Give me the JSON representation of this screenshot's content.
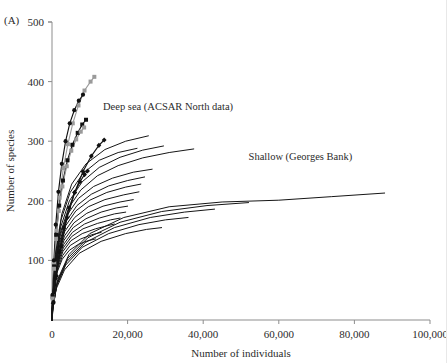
{
  "panel": {
    "label": "(A)"
  },
  "axes": {
    "x": {
      "title": "Number of individuals",
      "ticks": [
        0,
        20000,
        40000,
        60000,
        80000,
        100000
      ],
      "tick_labels": [
        "0",
        "20,000",
        "40,000",
        "60,000",
        "80,000",
        "100,000"
      ],
      "min": 0,
      "max": 100000
    },
    "y": {
      "title": "Number of species",
      "ticks": [
        100,
        200,
        300,
        400,
        500
      ],
      "tick_labels": [
        "100",
        "200",
        "300",
        "400",
        "500"
      ],
      "min": 0,
      "max": 500
    }
  },
  "annotations": [
    {
      "name": "deep-sea-label",
      "text": "Deep sea (ACSAR North data)",
      "x": 13500,
      "y": 352
    },
    {
      "name": "shallow-label",
      "text": "Shallow (Georges Bank)",
      "x": 52000,
      "y": 268
    }
  ],
  "chart_data": {
    "type": "line",
    "title": "",
    "xlabel": "Number of individuals",
    "ylabel": "Number of species",
    "xlim": [
      0,
      100000
    ],
    "ylim": [
      0,
      500
    ],
    "grid": false,
    "legend": "none",
    "annotations": [
      "Deep sea (ACSAR North data)",
      "Shallow (Georges Bank)"
    ],
    "series": [
      {
        "name": "deep-sea-marked-gray-squares",
        "group": "Deep sea (ACSAR North data)",
        "marker": "square",
        "marker_color": "#9a9a9a",
        "line_color": "#9a9a9a",
        "x": [
          200,
          600,
          1200,
          2000,
          3000,
          4200,
          5500,
          7000,
          8600,
          10200,
          11200
        ],
        "y": [
          40,
          95,
          150,
          205,
          255,
          295,
          330,
          360,
          385,
          400,
          408
        ]
      },
      {
        "name": "deep-sea-marked-black-circles",
        "group": "Deep sea (ACSAR North data)",
        "marker": "circle",
        "marker_color": "#111111",
        "line_color": "#111111",
        "x": [
          150,
          500,
          1000,
          1700,
          2600,
          3600,
          4700,
          5900,
          7100,
          8200
        ],
        "y": [
          42,
          100,
          160,
          215,
          262,
          300,
          330,
          352,
          368,
          378
        ]
      },
      {
        "name": "deep-sea-marked-black-squares",
        "group": "Deep sea (ACSAR North data)",
        "marker": "square",
        "marker_color": "#111111",
        "line_color": "#111111",
        "x": [
          180,
          550,
          1100,
          1900,
          2900,
          4100,
          5400,
          6800,
          8000,
          9000
        ],
        "y": [
          38,
          90,
          143,
          192,
          234,
          268,
          294,
          314,
          328,
          336
        ]
      },
      {
        "name": "deep-sea-marked-gray-squares-2",
        "group": "Deep sea (ACSAR North data)",
        "marker": "square",
        "marker_color": "#9a9a9a",
        "line_color": "#9a9a9a",
        "x": [
          160,
          520,
          1050,
          1800,
          2750,
          3900,
          5100,
          6400,
          7600,
          8500
        ],
        "y": [
          36,
          86,
          136,
          183,
          224,
          258,
          284,
          303,
          316,
          323
        ]
      },
      {
        "name": "deep-sea-marked-black-diamonds",
        "group": "Deep sea (ACSAR North data)",
        "marker": "diamond",
        "marker_color": "#111111",
        "line_color": "#111111",
        "x": [
          400,
          1200,
          2400,
          4000,
          6000,
          8200,
          10400,
          12400,
          13800
        ],
        "y": [
          30,
          74,
          124,
          172,
          214,
          249,
          275,
          293,
          302
        ]
      },
      {
        "name": "deep-sea-marked-black-diamonds-2",
        "group": "Deep sea (ACSAR North data)",
        "marker": "diamond",
        "marker_color": "#111111",
        "line_color": "#111111",
        "x": [
          300,
          950,
          1900,
          3100,
          4500,
          6000,
          7400,
          8600,
          9400
        ],
        "y": [
          28,
          70,
          114,
          154,
          188,
          214,
          232,
          244,
          250
        ]
      },
      {
        "name": "deep-sea-plain-1",
        "group": "Deep sea (ACSAR North data)",
        "marker": "none",
        "x": [
          120,
          900,
          2600,
          5200,
          9000,
          14000,
          19500,
          25500
        ],
        "y": [
          30,
          110,
          178,
          228,
          262,
          286,
          300,
          309
        ]
      },
      {
        "name": "deep-sea-plain-2",
        "group": "Deep sea (ACSAR North data)",
        "marker": "none",
        "x": [
          120,
          850,
          2400,
          4800,
          8200,
          12500,
          17500,
          22500
        ],
        "y": [
          28,
          104,
          168,
          214,
          246,
          268,
          281,
          288
        ]
      },
      {
        "name": "deep-sea-plain-3",
        "group": "Deep sea (ACSAR North data)",
        "marker": "none",
        "x": [
          110,
          800,
          2300,
          4600,
          8000,
          12500,
          18000,
          24000,
          29500
        ],
        "y": [
          26,
          96,
          156,
          200,
          232,
          256,
          273,
          285,
          292
        ]
      },
      {
        "name": "deep-sea-plain-4",
        "group": "Deep sea (ACSAR North data)",
        "marker": "none",
        "x": [
          110,
          780,
          2200,
          4400,
          7600,
          12000,
          17500,
          24000,
          31000,
          37500
        ],
        "y": [
          25,
          90,
          146,
          188,
          218,
          242,
          259,
          272,
          281,
          287
        ]
      },
      {
        "name": "deep-sea-plain-5",
        "group": "Deep sea (ACSAR North data)",
        "marker": "none",
        "x": [
          100,
          700,
          2000,
          4000,
          7000,
          11000,
          16000,
          21500,
          26500
        ],
        "y": [
          24,
          86,
          138,
          176,
          204,
          224,
          238,
          248,
          253
        ]
      },
      {
        "name": "deep-sea-plain-6",
        "group": "Deep sea (ACSAR North data)",
        "marker": "none",
        "x": [
          100,
          700,
          1900,
          3800,
          6600,
          10400,
          15000,
          20000,
          24500
        ],
        "y": [
          23,
          82,
          130,
          166,
          192,
          211,
          225,
          234,
          240
        ]
      },
      {
        "name": "deep-sea-plain-7",
        "group": "Deep sea (ACSAR North data)",
        "marker": "none",
        "x": [
          95,
          650,
          1800,
          3600,
          6300,
          10000,
          14500,
          19500,
          23500
        ],
        "y": [
          22,
          78,
          124,
          158,
          183,
          201,
          214,
          223,
          228
        ]
      },
      {
        "name": "deep-sea-plain-8",
        "group": "Deep sea (ACSAR North data)",
        "marker": "none",
        "x": [
          90,
          620,
          1700,
          3400,
          6000,
          9600,
          14000,
          19000,
          23000
        ],
        "y": [
          21,
          74,
          117,
          149,
          172,
          190,
          202,
          210,
          215
        ]
      },
      {
        "name": "deep-sea-plain-9",
        "group": "Deep sea (ACSAR North data)",
        "marker": "none",
        "x": [
          90,
          600,
          1650,
          3300,
          5800,
          9200,
          13500,
          18000,
          21500
        ],
        "y": [
          20,
          70,
          111,
          141,
          163,
          179,
          191,
          198,
          202
        ]
      },
      {
        "name": "deep-sea-plain-10",
        "group": "Deep sea (ACSAR North data)",
        "marker": "none",
        "x": [
          85,
          580,
          1600,
          3200,
          5600,
          9000,
          13000,
          17000,
          20000
        ],
        "y": [
          19,
          66,
          105,
          134,
          155,
          170,
          181,
          188,
          191
        ]
      },
      {
        "name": "deep-sea-plain-11",
        "group": "Deep sea (ACSAR North data)",
        "marker": "none",
        "x": [
          85,
          560,
          1550,
          3100,
          5400,
          8600,
          12500,
          16500,
          19500
        ],
        "y": [
          18,
          63,
          100,
          127,
          147,
          161,
          171,
          178,
          181
        ]
      },
      {
        "name": "deep-sea-plain-12",
        "group": "Deep sea (ACSAR North data)",
        "marker": "none",
        "x": [
          80,
          540,
          1500,
          3000,
          5200,
          8200,
          12000,
          15500,
          18000
        ],
        "y": [
          17,
          60,
          95,
          121,
          140,
          153,
          162,
          168,
          171
        ]
      },
      {
        "name": "deep-sea-plain-13",
        "group": "Deep sea (ACSAR North data)",
        "marker": "none",
        "x": [
          80,
          520,
          1450,
          2900,
          5000,
          8000,
          11500,
          14500,
          16500
        ],
        "y": [
          16,
          57,
          90,
          115,
          133,
          145,
          153,
          158,
          161
        ]
      },
      {
        "name": "deep-sea-plain-14",
        "group": "Deep sea (ACSAR North data)",
        "marker": "none",
        "x": [
          75,
          500,
          1400,
          2800,
          4800,
          7600,
          10500,
          13000
        ],
        "y": [
          15,
          54,
          85,
          108,
          125,
          136,
          143,
          147
        ]
      },
      {
        "name": "deep-sea-plain-15",
        "group": "Deep sea (ACSAR North data)",
        "marker": "none",
        "x": [
          75,
          480,
          1350,
          2700,
          4600,
          7000,
          9500,
          11500
        ],
        "y": [
          14,
          51,
          80,
          102,
          117,
          127,
          133,
          136
        ]
      },
      {
        "name": "shallow-georges-bank-1",
        "group": "Shallow (Georges Bank)",
        "marker": "none",
        "x": [
          200,
          1500,
          4500,
          10000,
          19000,
          31000,
          45000,
          60000,
          74000,
          88000
        ],
        "y": [
          22,
          68,
          110,
          145,
          172,
          190,
          198,
          201,
          207,
          213
        ]
      },
      {
        "name": "shallow-georges-bank-2",
        "group": "Shallow (Georges Bank)",
        "marker": "none",
        "x": [
          200,
          1400,
          4200,
          9500,
          18000,
          29000,
          41000,
          52000
        ],
        "y": [
          20,
          64,
          104,
          138,
          164,
          182,
          192,
          197
        ]
      },
      {
        "name": "shallow-georges-bank-3",
        "group": "Shallow (Georges Bank)",
        "marker": "none",
        "x": [
          180,
          1300,
          3900,
          8800,
          16500,
          26000,
          35000,
          43000
        ],
        "y": [
          19,
          60,
          98,
          130,
          155,
          172,
          181,
          186
        ]
      },
      {
        "name": "shallow-georges-bank-4",
        "group": "Shallow (Georges Bank)",
        "marker": "none",
        "x": [
          180,
          1200,
          3600,
          8000,
          15000,
          23000,
          30000,
          36000
        ],
        "y": [
          18,
          57,
          92,
          122,
          145,
          160,
          168,
          172
        ]
      },
      {
        "name": "shallow-georges-bank-5",
        "group": "Shallow (Georges Bank)",
        "marker": "none",
        "x": [
          160,
          1100,
          3300,
          7200,
          13000,
          19500,
          25000,
          29000
        ],
        "y": [
          16,
          52,
          84,
          112,
          132,
          145,
          152,
          155
        ]
      }
    ]
  }
}
